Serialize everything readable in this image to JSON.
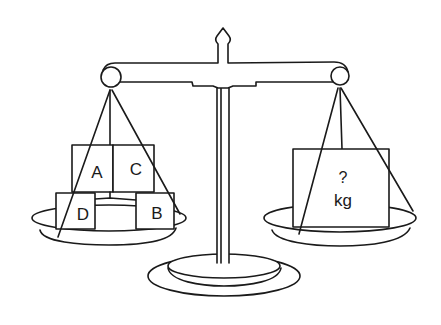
{
  "diagram": {
    "type": "balance-scale",
    "colors": {
      "line": "#1a1a1a",
      "background": "#ffffff"
    },
    "left_pan": {
      "blocks": [
        {
          "id": "A",
          "label": "A"
        },
        {
          "id": "C",
          "label": "C"
        },
        {
          "id": "D",
          "label": "D"
        },
        {
          "id": "B",
          "label": "B"
        }
      ]
    },
    "right_pan": {
      "block": {
        "label_line1": "?",
        "label_line2": "kg"
      }
    }
  }
}
